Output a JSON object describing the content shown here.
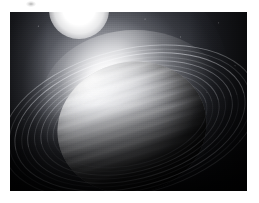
{
  "page": {
    "background_color": "#ffffff",
    "width": 259,
    "height": 203
  },
  "artwork": {
    "title": "Ringed gas giant planet with distant sun",
    "alt_text": "Grayscale space art illustration of a banded ringed gas giant lit by a bright star above it",
    "frame": {
      "x": 10,
      "y": 12,
      "width": 237,
      "height": 179
    },
    "palette": {
      "space_black": "#05060a",
      "space_haze": "#2a2c32",
      "star_white": "#ffffff",
      "planet_highlight": "#f2f2f4",
      "planet_midtone": "#9a9ba0",
      "planet_shadow": "#15161a",
      "ring_bright": "#b9bac0",
      "ring_dark": "#1b1c20"
    },
    "elements": [
      {
        "name": "sun",
        "label": "Sun",
        "center_x": 105,
        "center_y": 42,
        "core_radius": 16,
        "glow_radius": 62,
        "color": "#ffffff"
      },
      {
        "name": "planet",
        "label": "Gas giant",
        "center_x": 128,
        "center_y": 124,
        "radius_x": 75,
        "radius_y": 65,
        "tilt_degrees": -13,
        "band_count": 14,
        "lit_from": "upper-left"
      },
      {
        "name": "ring-system",
        "label": "Ring system",
        "tilt_degrees": -14,
        "ring_count": 9,
        "brighter_side": "left",
        "darker_side": "right"
      }
    ]
  },
  "artifact": {
    "name": "scan-artifact",
    "label": "Faint scan mark",
    "x": 26,
    "y": 1,
    "width": 10,
    "height": 6
  }
}
